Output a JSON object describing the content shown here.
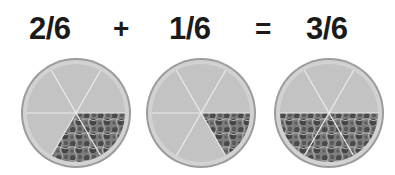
{
  "equation": {
    "terms": [
      {
        "label": "2/6",
        "numerator": 2,
        "denominator": 6
      },
      {
        "label": "1/6",
        "numerator": 1,
        "denominator": 6
      },
      {
        "label": "3/6",
        "numerator": 3,
        "denominator": 6
      }
    ],
    "operators": [
      "+",
      "="
    ]
  },
  "pizzas": [
    {
      "name": "pizza-two-sixths",
      "slices": 6,
      "topped_slices": 2
    },
    {
      "name": "pizza-one-sixth",
      "slices": 6,
      "topped_slices": 1
    },
    {
      "name": "pizza-three-sixths",
      "slices": 6,
      "topped_slices": 3
    }
  ],
  "colors": {
    "plate_ring": "#9c9c9c",
    "crust": "#d2d2d2",
    "slice": "#c3c3c3",
    "slice_line": "#ececec",
    "topping_dark": "#4a4a4a",
    "topping_mid": "#7d7d7d",
    "topping_light": "#b9b9b9"
  }
}
